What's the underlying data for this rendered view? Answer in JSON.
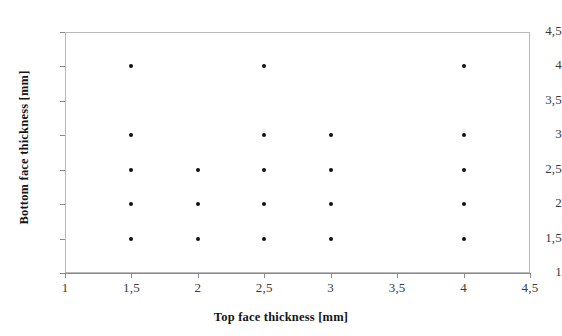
{
  "chart_data": {
    "type": "scatter",
    "title": "",
    "xlabel": "Top face thickness [mm]",
    "ylabel": "Bottom face thickness [mm]",
    "xlim": [
      1,
      4.5
    ],
    "ylim": [
      1,
      4.5
    ],
    "xticks": [
      1,
      1.5,
      2,
      2.5,
      3,
      3.5,
      4,
      4.5
    ],
    "yticks": [
      1,
      1.5,
      2,
      2.5,
      3,
      3.5,
      4,
      4.5
    ],
    "xticklabels": [
      "1",
      "1,5",
      "2",
      "2,5",
      "3",
      "3,5",
      "4",
      "4,5"
    ],
    "yticklabels": [
      "1",
      "1,5",
      "2",
      "2,5",
      "3",
      "3,5",
      "4",
      "4,5"
    ],
    "grid": false,
    "legend": false,
    "marker": "filled-circle",
    "marker_color": "#111111",
    "frame_color": "#b9b9b9",
    "background": "#ffffff",
    "points": [
      {
        "x": 1.5,
        "y": 4
      },
      {
        "x": 1.5,
        "y": 3
      },
      {
        "x": 1.5,
        "y": 2.5
      },
      {
        "x": 1.5,
        "y": 2
      },
      {
        "x": 1.5,
        "y": 1.5
      },
      {
        "x": 2,
        "y": 2.5
      },
      {
        "x": 2,
        "y": 2
      },
      {
        "x": 2,
        "y": 1.5
      },
      {
        "x": 2.5,
        "y": 4
      },
      {
        "x": 2.5,
        "y": 3
      },
      {
        "x": 2.5,
        "y": 2.5
      },
      {
        "x": 2.5,
        "y": 2
      },
      {
        "x": 2.5,
        "y": 1.5
      },
      {
        "x": 3,
        "y": 3
      },
      {
        "x": 3,
        "y": 2.5
      },
      {
        "x": 3,
        "y": 2
      },
      {
        "x": 3,
        "y": 1.5
      },
      {
        "x": 4,
        "y": 4
      },
      {
        "x": 4,
        "y": 3
      },
      {
        "x": 4,
        "y": 2.5
      },
      {
        "x": 4,
        "y": 2
      },
      {
        "x": 4,
        "y": 1.5
      }
    ]
  }
}
